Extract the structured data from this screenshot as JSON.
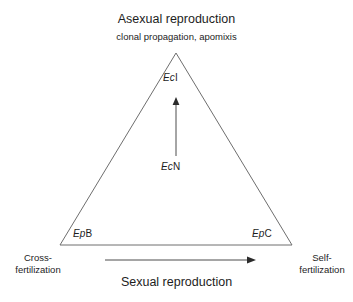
{
  "figure": {
    "type": "triangle-conceptual-diagram",
    "background_color": "#ffffff",
    "stroke_color": "#6e6e6e",
    "text_color": "#1d1d1d"
  },
  "top_axis": {
    "title": "Asexual reproduction",
    "subtitle": "clonal propagation, apomixis"
  },
  "bottom_axis": {
    "caption": "Sexual reproduction",
    "left_end": "Cross-fertilization",
    "right_end": "Self-fertilization"
  },
  "taxa": [
    {
      "id": "eci",
      "genus": "Ec",
      "species": "I",
      "position": "apex"
    },
    {
      "id": "ecn",
      "genus": "Ec",
      "species": "N",
      "position": "center"
    },
    {
      "id": "epb",
      "genus": "Ep",
      "species": "B",
      "position": "bottom-left"
    },
    {
      "id": "epc",
      "genus": "Ep",
      "species": "C",
      "position": "bottom-right"
    }
  ],
  "arrows": [
    {
      "id": "vertical-arrow",
      "direction": "up",
      "from": "EcN",
      "to": "EcI"
    },
    {
      "id": "horizontal-arrow",
      "direction": "right",
      "from": "Cross-fertilization",
      "to": "Self-fertilization"
    }
  ]
}
